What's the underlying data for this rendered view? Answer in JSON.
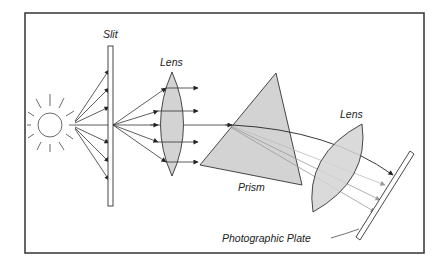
{
  "diagram": {
    "type": "optical-spectrometer",
    "labels": {
      "slit": "Slit",
      "lens1": "Lens",
      "prism": "Prism",
      "lens2": "Lens",
      "plate": "Photographic Plate"
    },
    "components": [
      {
        "id": "light-source",
        "name": "Sun / light source"
      },
      {
        "id": "slit",
        "name": "Slit"
      },
      {
        "id": "lens1",
        "name": "Collimating lens"
      },
      {
        "id": "prism",
        "name": "Prism"
      },
      {
        "id": "lens2",
        "name": "Focusing lens"
      },
      {
        "id": "plate",
        "name": "Photographic Plate"
      }
    ],
    "colors": {
      "frame": "#333333",
      "stroke": "#333333",
      "fill_gray": "#d3d3d3",
      "dispersed_ray": "#999999"
    }
  }
}
